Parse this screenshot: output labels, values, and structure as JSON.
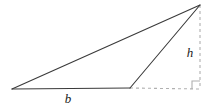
{
  "figure": {
    "kind": "geometry-diagram",
    "background_color": "#ffffff",
    "solid_stroke_color": "#3a3a3a",
    "dashed_stroke_color": "#b0b0b0",
    "solid_stroke_width": 1.1,
    "dashed_stroke_width": 1.1,
    "dash_pattern": "3,3",
    "labels": {
      "base": "b",
      "height": "h"
    },
    "points": {
      "left_vertex": {
        "x": 12,
        "y": 89
      },
      "base_right_vertex": {
        "x": 130,
        "y": 88
      },
      "apex": {
        "x": 200,
        "y": 5
      },
      "foot_of_height": {
        "x": 200,
        "y": 89
      }
    },
    "label_positions": {
      "base": {
        "x": 68,
        "y": 103
      },
      "height": {
        "x": 190,
        "y": 57
      }
    },
    "right_angle_marker": {
      "size": 8,
      "corner_x": 200,
      "corner_y": 89
    }
  }
}
